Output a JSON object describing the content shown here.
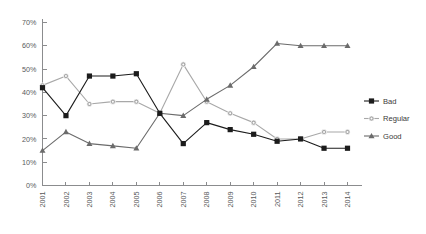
{
  "chart_data": {
    "type": "line",
    "title": "",
    "subtitle": "",
    "xlabel": "",
    "ylabel": "",
    "categories": [
      "2001",
      "2002",
      "2003",
      "2004",
      "2005",
      "2006",
      "2007",
      "2008",
      "2009",
      "2010",
      "2011",
      "2012",
      "2013",
      "2014"
    ],
    "ylim": [
      0,
      70
    ],
    "yticks": [
      "0%",
      "10%",
      "20%",
      "30%",
      "40%",
      "50%",
      "60%",
      "70%"
    ],
    "ytick_values": [
      0,
      10,
      20,
      30,
      40,
      50,
      60,
      70
    ],
    "grid": false,
    "legend_position": "right",
    "series": [
      {
        "name": "Bad",
        "color": "#1c1c1c",
        "marker": "square",
        "values": [
          42,
          30,
          47,
          47,
          48,
          31,
          18,
          27,
          24,
          22,
          19,
          20,
          16,
          16
        ]
      },
      {
        "name": "Regular",
        "color": "#a8a8a8",
        "marker": "circle",
        "values": [
          43,
          47,
          35,
          36,
          36,
          31,
          52,
          36,
          31,
          27,
          20,
          20,
          23,
          23
        ]
      },
      {
        "name": "Good",
        "color": "#6b6b6b",
        "marker": "triangle",
        "values": [
          15,
          23,
          18,
          17,
          16,
          31,
          30,
          37,
          43,
          51,
          61,
          60,
          60,
          60
        ]
      }
    ]
  },
  "legend": {
    "items": [
      {
        "label": "Bad"
      },
      {
        "label": "Regular"
      },
      {
        "label": "Good"
      }
    ]
  },
  "axis": {
    "color": "#8b8c8e"
  }
}
